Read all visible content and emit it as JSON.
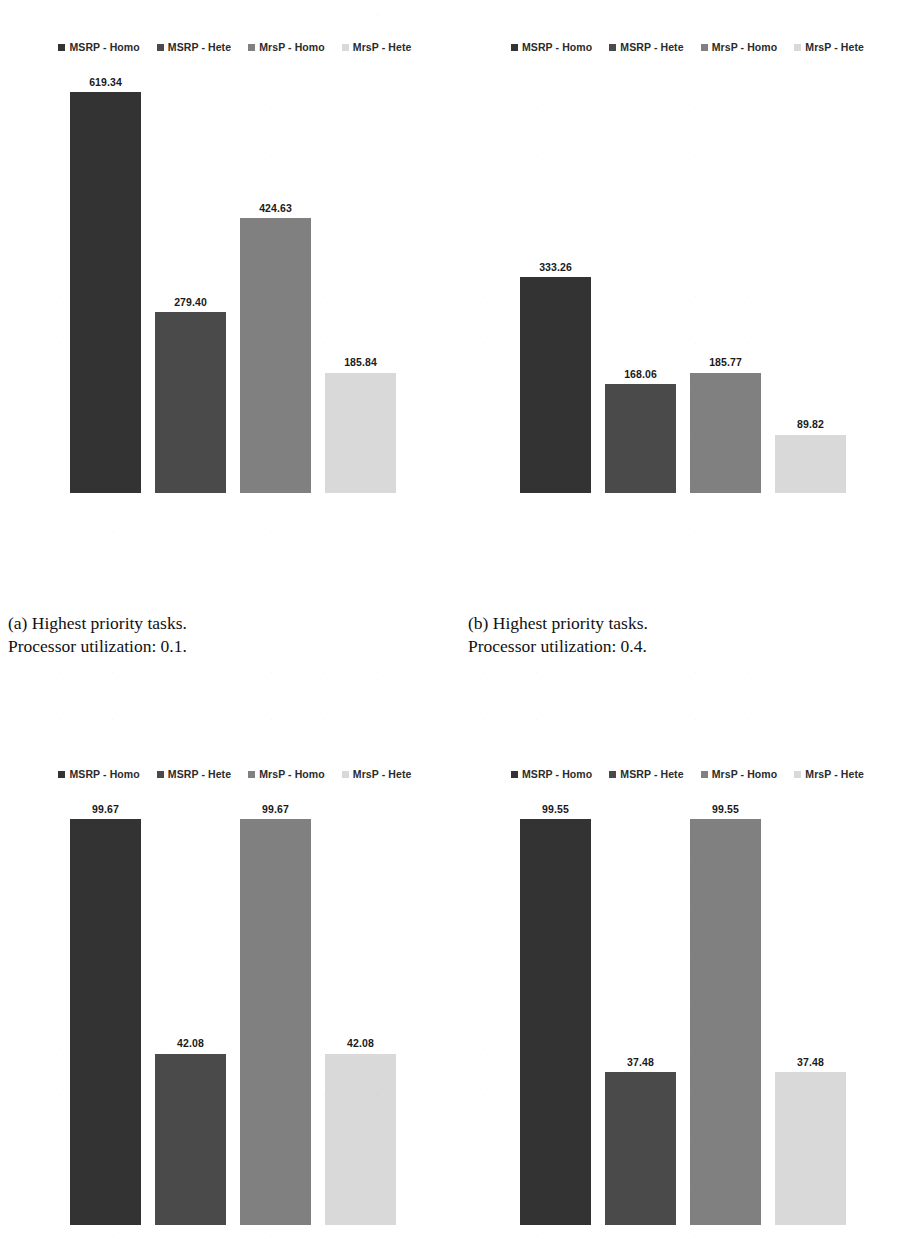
{
  "figure": {
    "background": "#ffffff",
    "series_colors": {
      "msrp_homo": "#333333",
      "msrp_hete": "#4a4a4a",
      "mrsp_homo": "#808080",
      "mrsp_hete": "#d9d9d9"
    },
    "legend_labels": {
      "msrp_homo": "MSRP - Homo",
      "msrp_hete": "MSRP - Hete",
      "mrsp_homo": "MrsP - Homo",
      "mrsp_hete": "MrsP - Hete"
    }
  },
  "captions": {
    "a": "(a) Highest priority tasks.\nProcessor utilization: 0.1.",
    "b": "(b) Highest priority tasks.\nProcessor utilization: 0.4."
  },
  "chart_data": [
    {
      "id": "chart-a",
      "type": "bar",
      "title": "",
      "subtitle": "(a) Highest priority tasks. Processor utilization: 0.1.",
      "xlabel": "",
      "ylabel": "",
      "grid": false,
      "legend_position": "top",
      "categories": [
        "MSRP - Homo",
        "MSRP - Hete",
        "MrsP - Homo",
        "MrsP - Hete"
      ],
      "values": [
        619.34,
        279.4,
        424.63,
        185.84
      ],
      "value_labels": [
        "619.34",
        "279.40",
        "424.63",
        "185.84"
      ],
      "colors": [
        "#333333",
        "#4a4a4a",
        "#808080",
        "#d9d9d9"
      ],
      "ylim": [
        0,
        619.34
      ]
    },
    {
      "id": "chart-b",
      "type": "bar",
      "title": "",
      "subtitle": "(b) Highest priority tasks. Processor utilization: 0.4.",
      "xlabel": "",
      "ylabel": "",
      "grid": false,
      "legend_position": "top",
      "categories": [
        "MSRP - Homo",
        "MSRP - Hete",
        "MrsP - Homo",
        "MrsP - Hete"
      ],
      "values": [
        333.26,
        168.06,
        185.77,
        89.82
      ],
      "value_labels": [
        "333.26",
        "168.06",
        "185.77",
        "89.82"
      ],
      "colors": [
        "#333333",
        "#4a4a4a",
        "#808080",
        "#d9d9d9"
      ],
      "ylim": [
        0,
        619.34
      ]
    },
    {
      "id": "chart-c",
      "type": "bar",
      "title": "",
      "subtitle": "",
      "xlabel": "",
      "ylabel": "",
      "grid": false,
      "legend_position": "top",
      "categories": [
        "MSRP - Homo",
        "MSRP - Hete",
        "MrsP - Homo",
        "MrsP - Hete"
      ],
      "values": [
        99.67,
        42.08,
        99.67,
        42.08
      ],
      "value_labels": [
        "99.67",
        "42.08",
        "99.67",
        "42.08"
      ],
      "colors": [
        "#333333",
        "#4a4a4a",
        "#808080",
        "#d9d9d9"
      ],
      "ylim": [
        0,
        99.67
      ]
    },
    {
      "id": "chart-d",
      "type": "bar",
      "title": "",
      "subtitle": "",
      "xlabel": "",
      "ylabel": "",
      "grid": false,
      "legend_position": "top",
      "categories": [
        "MSRP - Homo",
        "MSRP - Hete",
        "MrsP - Homo",
        "MrsP - Hete"
      ],
      "values": [
        99.55,
        37.48,
        99.55,
        37.48
      ],
      "value_labels": [
        "99.55",
        "37.48",
        "99.55",
        "37.48"
      ],
      "colors": [
        "#333333",
        "#4a4a4a",
        "#808080",
        "#d9d9d9"
      ],
      "ylim": [
        0,
        99.55
      ]
    }
  ]
}
